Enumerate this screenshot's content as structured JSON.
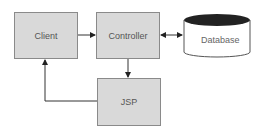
{
  "nodes": {
    "client": {
      "label": "Client"
    },
    "controller": {
      "label": "Controller"
    },
    "database": {
      "label": "Database"
    },
    "jsp": {
      "label": "JSP"
    }
  },
  "edges": [
    {
      "from": "Client",
      "to": "Controller",
      "direction": "one-way"
    },
    {
      "from": "Controller",
      "to": "Database",
      "direction": "two-way"
    },
    {
      "from": "Controller",
      "to": "JSP",
      "direction": "one-way"
    },
    {
      "from": "JSP",
      "to": "Client",
      "direction": "one-way"
    }
  ],
  "colors": {
    "box_fill": "#d9d9d9",
    "box_border": "#8a8a8a",
    "db_top": "#222222",
    "line": "#333333"
  }
}
